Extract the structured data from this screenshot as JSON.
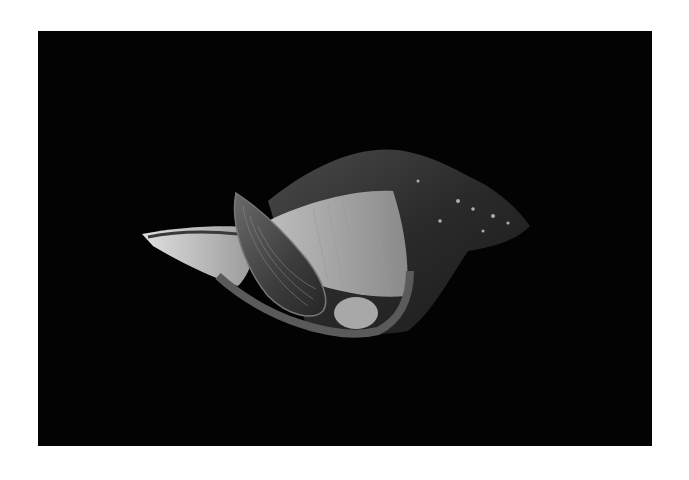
{
  "image": {
    "subject": "whelk shell with attached mussel",
    "background_color": "#030303",
    "page_color": "#ffffff",
    "style": "black-and-white photograph"
  }
}
